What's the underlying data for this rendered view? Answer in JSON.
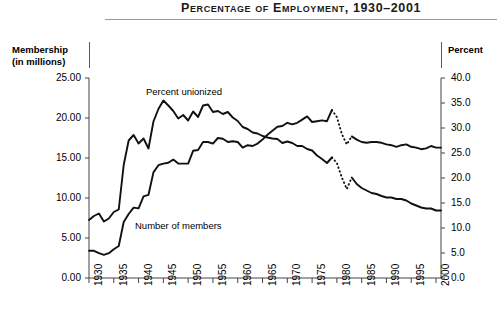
{
  "header": {
    "title": "Percentage of Employment, 1930–2001"
  },
  "axis_captions": {
    "left_line1": "Membership",
    "left_line2": "(in millions)",
    "right": "Percent"
  },
  "chart_data": {
    "type": "line",
    "title": "Percentage of Employment, 1930–2001",
    "xlabel": "",
    "ylabel": "Membership (in millions)",
    "y2label": "Percent",
    "xlim": [
      1930,
      2001
    ],
    "ylim": [
      0.0,
      25.0
    ],
    "y2lim": [
      0.0,
      40.0
    ],
    "grid": false,
    "legend": "inline-annotations",
    "x_tick_labels": [
      "1930",
      "1935",
      "1940",
      "1945",
      "1950",
      "1955",
      "1960",
      "1965",
      "1970",
      "1975",
      "1980",
      "1985",
      "1990",
      "1995",
      "2000"
    ],
    "y_tick_labels": [
      "0.00",
      "5.00",
      "10.00",
      "15.00",
      "20.00",
      "25.00"
    ],
    "y2_tick_labels": [
      "0.0",
      "5.0",
      "10.0",
      "15.0",
      "20.0",
      "25.0",
      "30.0",
      "35.0",
      "40.0"
    ],
    "annotations": [
      {
        "text": "Percent unionized",
        "x": 1941,
        "y": 36.5
      },
      {
        "text": "Number of members",
        "x": 1938,
        "y": 6.4
      }
    ],
    "series": [
      {
        "name": "Percent unionized",
        "axis": "right",
        "units": "percent",
        "x": [
          1930,
          1931,
          1932,
          1933,
          1934,
          1935,
          1936,
          1937,
          1938,
          1939,
          1940,
          1941,
          1942,
          1943,
          1944,
          1945,
          1946,
          1947,
          1948,
          1949,
          1950,
          1951,
          1952,
          1953,
          1954,
          1955,
          1956,
          1957,
          1958,
          1959,
          1960,
          1961,
          1962,
          1963,
          1964,
          1965,
          1966,
          1967,
          1968,
          1969,
          1970,
          1971,
          1972,
          1973,
          1974,
          1975,
          1976,
          1977,
          1978,
          1979,
          1980,
          1981,
          1982,
          1983,
          1984,
          1985,
          1986,
          1987,
          1988,
          1989,
          1990,
          1991,
          1992,
          1993,
          1994,
          1995,
          1996,
          1997,
          1998,
          1999,
          2000,
          2001
        ],
        "y": [
          11.6,
          12.4,
          12.9,
          11.3,
          11.9,
          13.2,
          13.7,
          22.6,
          27.5,
          28.6,
          26.9,
          27.9,
          25.9,
          31.3,
          33.8,
          35.5,
          34.5,
          33.4,
          31.9,
          32.6,
          31.5,
          33.3,
          32.2,
          34.5,
          34.7,
          33.2,
          33.4,
          32.8,
          33.2,
          32.1,
          31.4,
          30.2,
          29.8,
          29.1,
          28.9,
          28.4,
          28.1,
          27.9,
          27.8,
          27.0,
          27.3,
          27.0,
          26.4,
          26.4,
          25.8,
          25.5,
          24.5,
          23.8,
          23.0,
          24.1,
          23.0,
          20.1,
          17.8,
          20.1,
          18.8,
          18.0,
          17.5,
          17.0,
          16.8,
          16.4,
          16.1,
          16.1,
          15.8,
          15.8,
          15.5,
          14.9,
          14.5,
          14.1,
          13.9,
          13.9,
          13.5,
          13.5
        ],
        "dashed_segment_x": [
          1979,
          1983
        ]
      },
      {
        "name": "Number of members",
        "axis": "left",
        "units": "millions",
        "x": [
          1930,
          1931,
          1932,
          1933,
          1934,
          1935,
          1936,
          1937,
          1938,
          1939,
          1940,
          1941,
          1942,
          1943,
          1944,
          1945,
          1946,
          1947,
          1948,
          1949,
          1950,
          1951,
          1952,
          1953,
          1954,
          1955,
          1956,
          1957,
          1958,
          1959,
          1960,
          1961,
          1962,
          1963,
          1964,
          1965,
          1966,
          1967,
          1968,
          1969,
          1970,
          1971,
          1972,
          1973,
          1974,
          1975,
          1976,
          1977,
          1978,
          1979,
          1980,
          1981,
          1982,
          1983,
          1984,
          1985,
          1986,
          1987,
          1988,
          1989,
          1990,
          1991,
          1992,
          1993,
          1994,
          1995,
          1996,
          1997,
          1998,
          1999,
          2000,
          2001
        ],
        "y": [
          3.4,
          3.4,
          3.1,
          2.9,
          3.1,
          3.6,
          4.0,
          7.0,
          8.0,
          8.8,
          8.7,
          10.2,
          10.4,
          13.2,
          14.1,
          14.3,
          14.4,
          14.8,
          14.3,
          14.3,
          14.3,
          15.9,
          16.0,
          17.0,
          17.0,
          16.8,
          17.5,
          17.4,
          17.0,
          17.1,
          17.0,
          16.3,
          16.6,
          16.5,
          16.8,
          17.3,
          17.9,
          18.4,
          18.9,
          19.0,
          19.4,
          19.2,
          19.4,
          19.8,
          20.2,
          19.5,
          19.6,
          19.7,
          19.6,
          21.0,
          20.1,
          18.0,
          16.7,
          17.7,
          17.3,
          17.0,
          16.9,
          17.0,
          17.0,
          16.9,
          16.7,
          16.6,
          16.4,
          16.6,
          16.7,
          16.4,
          16.3,
          16.1,
          16.2,
          16.5,
          16.3,
          16.3
        ],
        "dashed_segment_x": [
          1979,
          1983
        ]
      }
    ]
  }
}
